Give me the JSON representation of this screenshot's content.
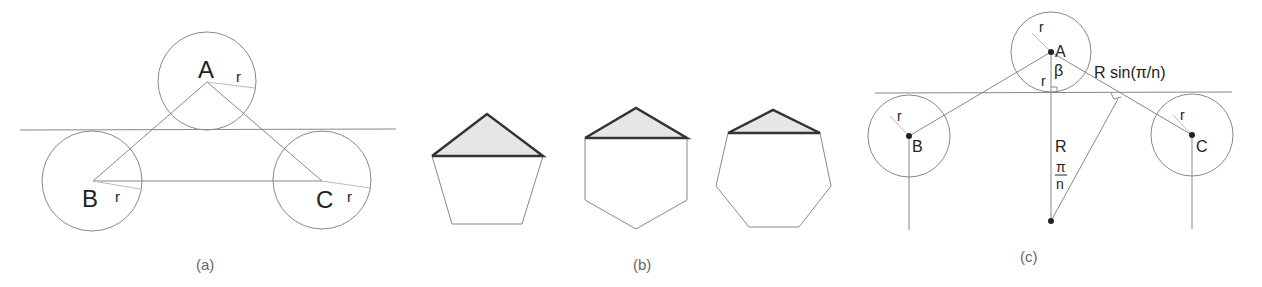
{
  "panels": {
    "a": {
      "caption": "(a)",
      "labels": {
        "A": "A",
        "B": "B",
        "C": "C",
        "rA": "r",
        "rB": "r",
        "rC": "r"
      }
    },
    "b": {
      "caption": "(b)",
      "shapes": [
        "pentagon",
        "hexagon",
        "heptagon"
      ],
      "fill_color": "#e6e6e6"
    },
    "c": {
      "caption": "(c)",
      "labels": {
        "A": "A",
        "B": "B",
        "C": "C",
        "rA": "r",
        "rA2": "r",
        "rB": "r",
        "rC": "r",
        "beta": "β",
        "R": "R",
        "pi": "π",
        "n": "n",
        "side": "R sin(π/n)"
      }
    }
  }
}
